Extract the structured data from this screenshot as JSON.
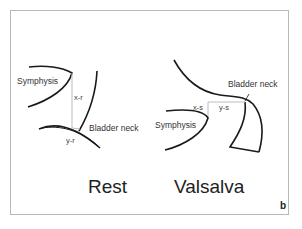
{
  "figure": {
    "panel_letter": "b",
    "rest": {
      "title": "Rest",
      "labels": {
        "symphysis": "Symphysis",
        "bladder_neck": "Bladder neck",
        "x": "x-r",
        "y": "y-r"
      }
    },
    "valsalva": {
      "title": "Valsalva",
      "labels": {
        "symphysis": "Symphysis",
        "bladder_neck": "Bladder neck",
        "x": "x-s",
        "y": "y-s"
      }
    },
    "colors": {
      "stroke": "#1a1a1a",
      "guide": "#bdbdbd",
      "frame": "#b8b8b8"
    }
  }
}
